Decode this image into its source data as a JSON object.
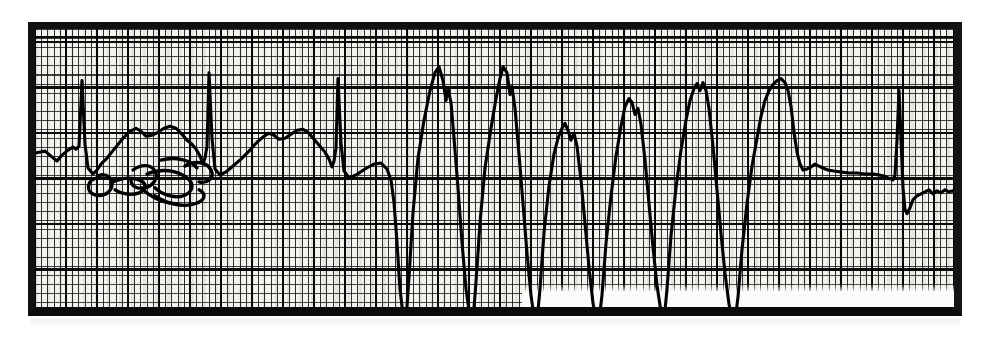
{
  "document": {
    "kind": "ecg-rhythm-strip",
    "caption": "",
    "paper_color": "#f4f3ef",
    "trace_color": "#000000",
    "border_color": "#0b0b0b"
  },
  "annotation": {
    "handwriting_present": true,
    "handwriting_text": "",
    "note": "illegible handwritten scrawl on the paper"
  },
  "chart_data": {
    "type": "line",
    "title": "",
    "subtitle": "",
    "xlabel": "",
    "ylabel": "",
    "grid": true,
    "legend_position": "none",
    "x": [],
    "series": [
      {
        "name": "ECG lead",
        "values": [],
        "path": "M 0,125 L 10,123 L 16,128 L 22,133 L 27,127 L 33,122 L 38,119 L 41,121 L 44,118 L 47,52 L 50,116 L 53,140 L 58,146 L 62,142 L 66,136 L 72,130 L 80,120 L 88,110 L 95,103 L 101,100 L 106,103 L 111,108 L 117,107 L 123,104 L 129,100 L 135,98 L 141,100 L 147,106 L 152,112 L 157,116 L 161,121 L 165,128 L 168,136 L 170,130 L 172,118 L 174,44 L 177,110 L 180,141 L 185,147 L 191,144 L 198,138 L 206,131 L 214,123 L 222,114 L 229,108 L 234,105 L 239,107 L 244,111 L 250,110 L 256,106 L 262,102 L 268,101 L 273,104 L 279,111 L 285,118 L 290,124 L 294,131 L 297,139 L 299,133 L 301,120 L 303,50 L 306,115 L 309,143 L 314,150 L 321,147 L 330,141 L 339,136 L 346,135 L 352,141 L 356,152 L 359,175 L 362,215 L 365,262 L 368,288 L 371,294 L 374,250 L 378,185 L 383,130 L 389,92 L 395,62 L 400,44 L 404,38 L 408,52 L 411,72 L 413,60 L 416,74 L 419,110 L 423,160 L 427,215 L 431,262 L 435,290 L 438,294 L 441,255 L 445,195 L 450,140 L 456,100 L 461,70 L 465,50 L 468,38 L 472,44 L 475,66 L 477,58 L 480,80 L 484,126 L 488,176 L 492,226 L 496,268 L 499,290 L 502,294 L 505,262 L 509,205 L 514,158 L 519,126 L 523,110 L 527,100 L 530,95 L 533,102 L 536,112 L 539,105 L 542,118 L 546,152 L 550,196 L 554,240 L 558,276 L 561,293 L 564,294 L 567,268 L 571,216 L 576,168 L 581,128 L 586,98 L 590,78 L 594,70 L 597,74 L 600,86 L 603,80 L 606,96 L 610,132 L 614,176 L 618,220 L 622,258 L 626,285 L 629,294 L 632,262 L 636,208 L 641,160 L 646,122 L 651,92 L 655,72 L 659,60 L 662,55 L 665,62 L 668,54 L 671,62 L 674,80 L 678,118 L 682,162 L 686,206 L 690,246 L 694,277 L 697,292 L 700,294 L 703,270 L 707,222 L 712,176 L 717,138 L 722,110 L 726,88 L 730,72 L 734,62 L 738,56 L 742,52 L 746,50 L 750,54 L 753,62 L 756,78 L 759,104 L 762,124 L 765,136 L 768,142 L 772,141 L 776,139 L 780,136 L 784,138 L 788,140 L 793,142 L 799,143 L 806,144 L 814,145 L 822,145 L 830,146 L 838,146 L 844,147 L 849,148 L 853,150 L 856,151 L 858,152 L 860,147 L 862,112 L 864,62 L 866,110 L 868,160 L 870,182 L 872,186 L 875,180 L 878,172 L 882,168 L 886,166 L 890,164 L 894,162 L 898,166 L 902,163 L 906,165 L 910,162 L 914,164 L 918,163 L 922,167 L 926,169 L 929,172 L 932,176 L 935,178 L 937,170 L 939,120 L 941,70 L 943,60 L 945,96 L 947,140 L 949,172 L 951,186 L 953,182 L 956,178 L 960,177 L 965,176 L 970,176 L 975,177 L 980,176"
      }
    ],
    "annotations": [
      {
        "name": "normal-sinus-beats-left",
        "x_range": [
          40,
          330
        ],
        "description": "three narrow-complex sinus beats with P and T waves"
      },
      {
        "name": "wide-complex-run",
        "x_range": [
          352,
          760
        ],
        "description": "run of eight wide bizarre ventricular complexes with tall positive peaks and deep negative deflections"
      },
      {
        "name": "return-to-baseline",
        "x_range": [
          760,
          980
        ],
        "description": "flat baseline with fine undulation, then two narrow sinus spikes"
      }
    ],
    "ylim": [
      0,
      294
    ],
    "xlim": [
      0,
      919
    ],
    "grid_minor_px": {
      "x": 6.2,
      "y": 9.1
    },
    "grid_major_px": {
      "x": 31,
      "y": 45.5
    }
  },
  "scribble": {
    "paths": [
      "M 62,150 C 52,152 50,164 60,167 C 70,170 80,162 76,152 C 73,145 64,146 62,150 Z",
      "M 76,155 C 86,150 96,149 104,152 C 112,155 112,162 104,165 C 96,168 86,166 80,162",
      "M 98,142 C 106,136 116,136 120,143 C 124,150 118,158 110,160 C 102,162 96,158 96,152",
      "M 112,146 C 126,140 142,142 152,150 C 160,156 158,165 148,168 C 138,171 126,166 120,160",
      "M 126,132 C 140,128 156,132 162,140",
      "M 150,138 C 160,132 172,134 176,142 C 180,150 172,156 164,154",
      "M 120,168 C 132,176 148,180 160,176 C 170,173 172,166 164,162",
      "M 106,160 C 116,170 130,176 142,176"
    ]
  }
}
